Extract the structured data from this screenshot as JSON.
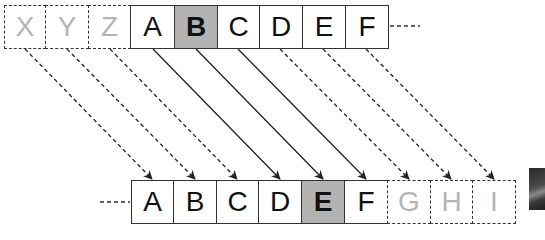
{
  "diagram": {
    "top_row": {
      "cells": [
        {
          "label": "X",
          "style": "ghost"
        },
        {
          "label": "Y",
          "style": "ghost"
        },
        {
          "label": "Z",
          "style": "ghost"
        },
        {
          "label": "A",
          "style": "normal"
        },
        {
          "label": "B",
          "style": "highlight"
        },
        {
          "label": "C",
          "style": "normal"
        },
        {
          "label": "D",
          "style": "normal"
        },
        {
          "label": "E",
          "style": "normal"
        },
        {
          "label": "F",
          "style": "normal"
        }
      ],
      "continuation": "right-dashed"
    },
    "bottom_row": {
      "cells": [
        {
          "label": "A",
          "style": "normal"
        },
        {
          "label": "B",
          "style": "normal"
        },
        {
          "label": "C",
          "style": "normal"
        },
        {
          "label": "D",
          "style": "normal"
        },
        {
          "label": "E",
          "style": "highlight"
        },
        {
          "label": "F",
          "style": "normal"
        },
        {
          "label": "G",
          "style": "ghost"
        },
        {
          "label": "H",
          "style": "ghost"
        },
        {
          "label": "I",
          "style": "ghost"
        }
      ],
      "continuation": "left-dashed"
    },
    "arrows": [
      {
        "from": "X",
        "to": "A",
        "style": "dashed"
      },
      {
        "from": "Y",
        "to": "B",
        "style": "dashed"
      },
      {
        "from": "Z",
        "to": "C",
        "style": "dashed"
      },
      {
        "from": "A",
        "to": "D",
        "style": "solid"
      },
      {
        "from": "B",
        "to": "E",
        "style": "solid"
      },
      {
        "from": "C",
        "to": "F",
        "style": "solid"
      },
      {
        "from": "D",
        "to": "G",
        "style": "dashed"
      },
      {
        "from": "E",
        "to": "H",
        "style": "dashed"
      },
      {
        "from": "F",
        "to": "I",
        "style": "dashed"
      }
    ],
    "colors": {
      "highlight_fill": "#b3b3b3",
      "ghost_text": "#b5b5b5",
      "stroke": "#333333"
    }
  }
}
